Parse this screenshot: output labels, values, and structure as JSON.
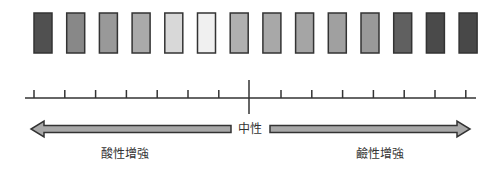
{
  "diagram": {
    "type": "ph-scale",
    "swatches": [
      {
        "index": 1,
        "color": "#505050"
      },
      {
        "index": 2,
        "color": "#888888"
      },
      {
        "index": 3,
        "color": "#999999"
      },
      {
        "index": 4,
        "color": "#aaaaaa"
      },
      {
        "index": 5,
        "color": "#d8d8d8"
      },
      {
        "index": 6,
        "color": "#f0f0f0"
      },
      {
        "index": 7,
        "color": "#b0b0b0"
      },
      {
        "index": 8,
        "color": "#a8a8a8"
      },
      {
        "index": 9,
        "color": "#a5a5a5"
      },
      {
        "index": 10,
        "color": "#a0a0a0"
      },
      {
        "index": 11,
        "color": "#999999"
      },
      {
        "index": 12,
        "color": "#606060"
      },
      {
        "index": 13,
        "color": "#4a4a4a"
      },
      {
        "index": 14,
        "color": "#484848"
      }
    ],
    "swatch_border_color": "#333333",
    "scale": {
      "ticks_left": 7,
      "ticks_right": 7,
      "center_marker": true,
      "line_color": "#333333"
    },
    "arrows": {
      "fill": "#a8a8a8",
      "stroke": "#333333",
      "left_direction": "left",
      "right_direction": "right"
    },
    "labels": {
      "neutral": "中性",
      "acid": "酸性增強",
      "base": "鹼性增強"
    }
  }
}
